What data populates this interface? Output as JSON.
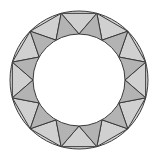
{
  "diagram": {
    "type": "annulus-triangulation",
    "center": [
      79,
      80
    ],
    "outer_radius": 69,
    "inner_radius": 46,
    "segments": 12,
    "outer_vertex_offset_deg": 15,
    "inner_vertex_offset_deg": 0,
    "colors": {
      "background": "#ffffff",
      "ring_fill": "#d4d4d4",
      "inward_triangle_fill": "#d0d0d0",
      "outward_triangle_fill": "#b3b3b3",
      "stroke": "#3a3a3a",
      "inner_hole": "#ffffff"
    },
    "stroke_width": 1
  }
}
